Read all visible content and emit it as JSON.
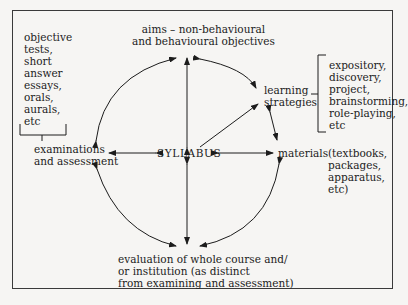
{
  "diagram": {
    "center": "SYLLABUS",
    "nodes": {
      "aims": "aims – non-behavioural\nand behavioural objectives",
      "learning_strategies": "learning\nstrategies",
      "materials": "materials",
      "evaluation": "evaluation of whole course and/\nor institution (as distinct\nfrom examining and assessment)",
      "examinations": "examinations\nand assessment"
    },
    "annotations": {
      "examinations_examples": "objective\ntests,\nshort\nanswer\nessays,\norals,\naurals,\netc",
      "learning_strategies_examples": "expository,\ndiscovery,\nproject,\nbrainstorming,\nrole-playing,\netc",
      "materials_examples": "(textbooks,\npackages,\napparatus,\netc)"
    },
    "connections": [
      {
        "from": "SYLLABUS",
        "to": "aims",
        "type": "double-arrow"
      },
      {
        "from": "SYLLABUS",
        "to": "materials",
        "type": "double-arrow"
      },
      {
        "from": "SYLLABUS",
        "to": "evaluation",
        "type": "double-arrow"
      },
      {
        "from": "SYLLABUS",
        "to": "examinations",
        "type": "double-arrow"
      },
      {
        "from": "SYLLABUS",
        "to": "learning_strategies",
        "type": "arrow"
      },
      {
        "from": "aims",
        "to": "learning_strategies",
        "type": "curved-double-arrow"
      },
      {
        "from": "learning_strategies",
        "to": "materials",
        "type": "double-arrow"
      },
      {
        "from": "materials",
        "to": "evaluation",
        "type": "curved-double-arrow"
      },
      {
        "from": "evaluation",
        "to": "examinations",
        "type": "curved-double-arrow"
      },
      {
        "from": "examinations",
        "to": "aims",
        "type": "curved-double-arrow"
      }
    ]
  }
}
